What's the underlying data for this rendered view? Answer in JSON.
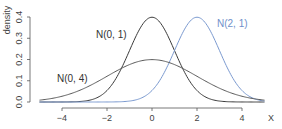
{
  "chart_data": {
    "type": "line",
    "title": "",
    "xlabel": "X",
    "ylabel": "density",
    "xlim": [
      -5,
      5
    ],
    "ylim": [
      0,
      0.4
    ],
    "x_ticks": [
      "−4",
      "−2",
      "0",
      "2",
      "4"
    ],
    "x_tick_values": [
      -4,
      -2,
      0,
      2,
      4
    ],
    "y_ticks": [
      "0.0",
      "0.1",
      "0.2",
      "0.3",
      "0.4"
    ],
    "y_tick_values": [
      0,
      0.1,
      0.2,
      0.3,
      0.4
    ],
    "grid": false,
    "legend": "inline labels",
    "series": [
      {
        "name": "N(0, 1)",
        "mean": 0,
        "variance": 1,
        "color": "#3a3a3a",
        "label_pos": {
          "x": 96,
          "y": 38
        }
      },
      {
        "name": "N(2, 1)",
        "mean": 2,
        "variance": 1,
        "color": "#7b9ad0",
        "label_pos": {
          "x": 217,
          "y": 27
        }
      },
      {
        "name": "N(0, 4)",
        "mean": 0,
        "variance": 4,
        "color": "#5a5a5a",
        "label_pos": {
          "x": 57,
          "y": 82
        }
      }
    ]
  }
}
